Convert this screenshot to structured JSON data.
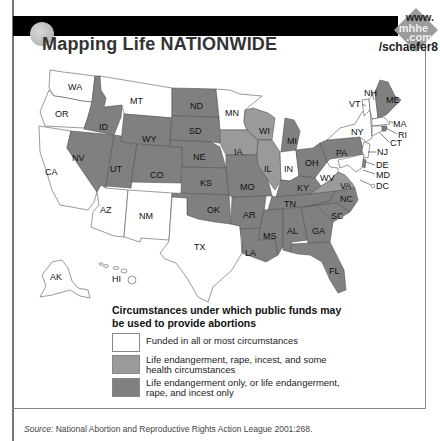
{
  "header": {
    "title": "Mapping Life NATIONWIDE",
    "web_link": {
      "line1": "www.",
      "line2": "mhhe",
      "line3": ".com",
      "line4": "/schaefer8"
    }
  },
  "colors": {
    "white": "#ffffff",
    "medium_gray": "#9a9a9a",
    "dark_gray": "#808080",
    "title_bar": "#000000"
  },
  "map": {
    "states": {
      "WA": {
        "label": "WA",
        "category": "funded_all"
      },
      "OR": {
        "label": "OR",
        "category": "funded_all"
      },
      "CA": {
        "label": "CA",
        "category": "funded_all"
      },
      "ID": {
        "label": "ID",
        "category": "life_rape_incest_only"
      },
      "NV": {
        "label": "NV",
        "category": "life_rape_incest_only"
      },
      "MT": {
        "label": "MT",
        "category": "funded_all"
      },
      "WY": {
        "label": "WY",
        "category": "life_rape_incest_only"
      },
      "UT": {
        "label": "UT",
        "category": "life_rape_incest_only"
      },
      "CO": {
        "label": "CO",
        "category": "life_rape_incest_only"
      },
      "AZ": {
        "label": "AZ",
        "category": "funded_all"
      },
      "NM": {
        "label": "NM",
        "category": "funded_all"
      },
      "ND": {
        "label": "ND",
        "category": "life_rape_incest_only"
      },
      "SD": {
        "label": "SD",
        "category": "life_rape_incest_only"
      },
      "NE": {
        "label": "NE",
        "category": "life_rape_incest_only"
      },
      "KS": {
        "label": "KS",
        "category": "life_rape_incest_only"
      },
      "OK": {
        "label": "OK",
        "category": "life_rape_incest_only"
      },
      "TX": {
        "label": "TX",
        "category": "funded_all"
      },
      "MN": {
        "label": "MN",
        "category": "funded_all"
      },
      "IA": {
        "label": "IA",
        "category": "life_rape_incest_health"
      },
      "MO": {
        "label": "MO",
        "category": "life_rape_incest_only"
      },
      "AR": {
        "label": "AR",
        "category": "life_rape_incest_only"
      },
      "LA": {
        "label": "LA",
        "category": "life_rape_incest_only"
      },
      "WI": {
        "label": "WI",
        "category": "life_rape_incest_health"
      },
      "IL": {
        "label": "IL",
        "category": "life_rape_incest_health"
      },
      "MI": {
        "label": "MI",
        "category": "life_rape_incest_only"
      },
      "IN": {
        "label": "IN",
        "category": "funded_all"
      },
      "OH": {
        "label": "OH",
        "category": "life_rape_incest_only"
      },
      "KY": {
        "label": "KY",
        "category": "life_rape_incest_only"
      },
      "TN": {
        "label": "TN",
        "category": "life_rape_incest_only"
      },
      "MS": {
        "label": "MS",
        "category": "life_rape_incest_only"
      },
      "AL": {
        "label": "AL",
        "category": "life_rape_incest_only"
      },
      "GA": {
        "label": "GA",
        "category": "life_rape_incest_only"
      },
      "FL": {
        "label": "FL",
        "category": "life_rape_incest_only"
      },
      "SC": {
        "label": "SC",
        "category": "life_rape_incest_only"
      },
      "NC": {
        "label": "NC",
        "category": "life_rape_incest_only"
      },
      "VA": {
        "label": "VA",
        "category": "life_rape_incest_health"
      },
      "WV": {
        "label": "WV",
        "category": "funded_all"
      },
      "PA": {
        "label": "PA",
        "category": "life_rape_incest_only"
      },
      "NY": {
        "label": "NY",
        "category": "funded_all"
      },
      "VT": {
        "label": "VT",
        "category": "funded_all"
      },
      "NH": {
        "label": "NH",
        "category": "funded_all"
      },
      "ME": {
        "label": "ME",
        "category": "life_rape_incest_only"
      },
      "MA": {
        "label": "MA",
        "category": "funded_all"
      },
      "RI": {
        "label": "RI",
        "category": "life_rape_incest_only"
      },
      "CT": {
        "label": "CT",
        "category": "funded_all"
      },
      "NJ": {
        "label": "NJ",
        "category": "funded_all"
      },
      "DE": {
        "label": "DE",
        "category": "life_rape_incest_only"
      },
      "MD": {
        "label": "MD",
        "category": "funded_all"
      },
      "DC": {
        "label": "DC",
        "category": "funded_all"
      },
      "AK": {
        "label": "AK",
        "category": "funded_all"
      },
      "HI": {
        "label": "HI",
        "category": "funded_all"
      }
    }
  },
  "legend": {
    "title": "Circumstances under which public funds may be used to provide abortions",
    "items": [
      {
        "key": "funded_all",
        "color": "#ffffff",
        "label": "Funded in all or most circumstances"
      },
      {
        "key": "life_rape_incest_health",
        "color": "#9a9a9a",
        "label": "Life endangerment, rape, incest, and some health circumstances"
      },
      {
        "key": "life_rape_incest_only",
        "color": "#808080",
        "label": "Life endangerment only, or life endangerment, rape, and incest only"
      }
    ]
  },
  "source": {
    "prefix": "Source:",
    "text": " National Abortion and Reproductive Rights Action League 2001:268."
  }
}
